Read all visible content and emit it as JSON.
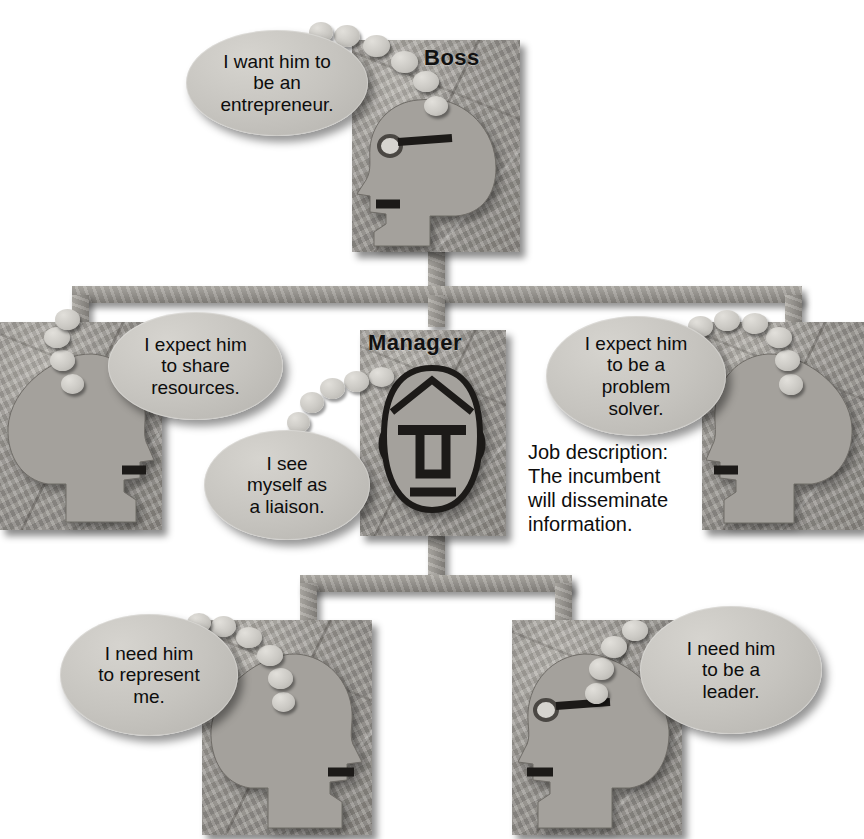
{
  "diagram": {
    "background_color": "#ffffff",
    "stone_color": "#9b9893",
    "bubble_color": "#c6c4bf",
    "text_color": "#0d0d0d"
  },
  "caption": {
    "job_description": "Job description:\nThe incumbent\nwill disseminate\ninformation."
  },
  "nodes": [
    {
      "id": "boss",
      "label": "Boss",
      "face": "profile-left",
      "bubble": {
        "lines": [
          "I want him to",
          "be an",
          "entrepreneur."
        ]
      }
    },
    {
      "id": "peer-left",
      "label": "",
      "face": "profile-right",
      "bubble": {
        "lines": [
          "I expect him",
          "to share",
          "resources."
        ]
      }
    },
    {
      "id": "manager",
      "label": "Manager",
      "face": "front",
      "bubble": {
        "lines": [
          "I see",
          "myself as",
          "a liaison."
        ]
      }
    },
    {
      "id": "peer-right",
      "label": "",
      "face": "profile-left",
      "bubble": {
        "lines": [
          "I expect him",
          "to be a",
          "problem",
          "solver."
        ]
      }
    },
    {
      "id": "report-left",
      "label": "",
      "face": "profile-right",
      "bubble": {
        "lines": [
          "I need him",
          "to represent",
          "me."
        ]
      }
    },
    {
      "id": "report-right",
      "label": "",
      "face": "profile-left",
      "bubble": {
        "lines": [
          "I need him",
          "to be a",
          "leader."
        ]
      }
    }
  ]
}
